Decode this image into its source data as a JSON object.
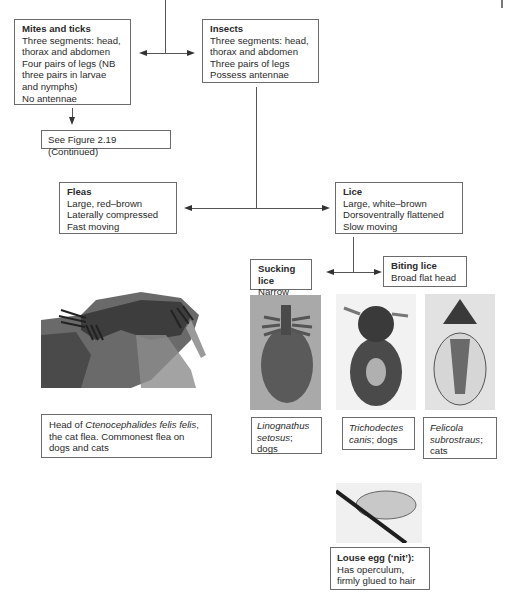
{
  "diagram": {
    "mites": {
      "title": "Mites and ticks",
      "lines": [
        "Three segments: head,",
        "thorax and abdomen",
        "Four pairs of legs (NB",
        "three pairs in larvae",
        "and nymphs)",
        "No antennae"
      ]
    },
    "insects": {
      "title": "Insects",
      "lines": [
        "Three segments: head,",
        "thorax and abdomen",
        "Three pairs of legs",
        "Possess antennae"
      ]
    },
    "see_figure": "See Figure 2.19 (Continued)",
    "fleas": {
      "title": "Fleas",
      "lines": [
        "Large, red–brown",
        "Laterally compressed",
        "Fast moving"
      ]
    },
    "lice": {
      "title": "Lice",
      "lines": [
        "Large, white–brown",
        "Dorsoventrally flattened",
        "Slow moving"
      ]
    },
    "sucking_lice": {
      "title": "Sucking lice",
      "desc": "Narrow head"
    },
    "biting_lice": {
      "title": "Biting lice",
      "desc": "Broad flat head"
    },
    "flea_caption": {
      "pre": "Head of ",
      "species": "Ctenocephalides felis felis",
      "post": ",",
      "line2": "the cat flea. Commonest flea on",
      "line3": "dogs and cats"
    },
    "linognathus": {
      "genus": "Linognathus",
      "species": "setosus",
      "sep": ";",
      "host": "dogs"
    },
    "trichodectes": {
      "genus": "Trichodectes",
      "species": "canis",
      "host": "; dogs"
    },
    "felicola": {
      "genus": "Felicola",
      "species": "subrostraus",
      "sep": ";",
      "host": "cats"
    },
    "louse_egg": {
      "title": "Louse egg (‘nit’):",
      "lines": [
        "Has operculum,",
        "firmly glued to hair"
      ]
    },
    "images": {
      "flea_head": "flea-head-micrograph",
      "linognathus": "linognathus-micrograph",
      "trichodectes": "trichodectes-micrograph",
      "felicola": "felicola-micrograph",
      "nit": "louse-egg-micrograph"
    }
  }
}
